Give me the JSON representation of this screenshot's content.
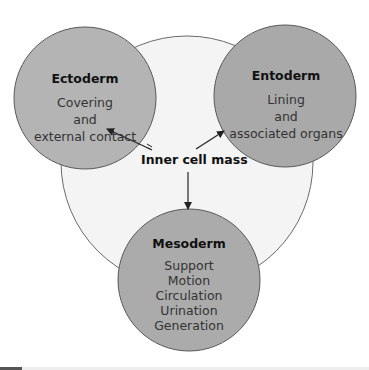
{
  "diagram": {
    "center": {
      "label": "Inner cell mass"
    },
    "layers": [
      {
        "name": "Ectoderm",
        "lines": [
          "Covering",
          "and",
          "external contact"
        ]
      },
      {
        "name": "Entoderm",
        "lines": [
          "Lining",
          "and",
          "associated organs"
        ]
      },
      {
        "name": "Mesoderm",
        "lines": [
          "Support",
          "Motion",
          "Circulation",
          "Urination",
          "Generation"
        ]
      }
    ],
    "colors": {
      "background_circle": "#f4f4f4",
      "ectoderm_fill": "#b4b4b4",
      "entoderm_fill": "#a9a9a9",
      "mesoderm_fill": "#ababab",
      "stroke": "#5a5a5a",
      "arrow": "#222222"
    }
  }
}
